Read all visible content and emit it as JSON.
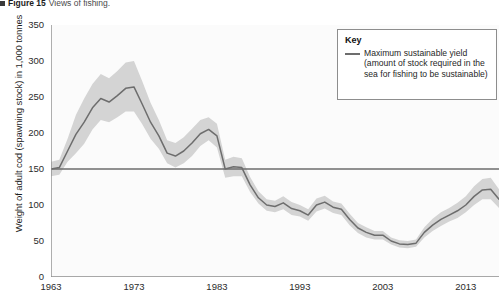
{
  "caption": {
    "figure_label": "Figure 15",
    "text": "Views of fishing."
  },
  "legend": {
    "title": "Key",
    "entries": [
      {
        "label": "Maximum sustainable yield (amount of stock required in the sea for fishing to be sustainable)",
        "color": "#6d6d6d"
      }
    ]
  },
  "colors": {
    "line": "#6d6d6d",
    "band": "#d2d2d2",
    "axis": "#8d8d8d",
    "msy_line": "#6d6d6d",
    "background": "#fbfbfb",
    "text": "#1f1f1f"
  },
  "chart_data": {
    "type": "line",
    "title": "",
    "xlabel": "",
    "ylabel": "Weight of adult cod (spawning stock) in 1,000 tonnes",
    "xlim": [
      1963,
      2017
    ],
    "ylim": [
      0,
      350
    ],
    "grid": false,
    "legend_position": "top-right",
    "yticks": [
      0,
      50,
      100,
      150,
      200,
      250,
      300,
      350
    ],
    "ytick_labels": [
      "0",
      "50",
      "100",
      "150",
      "200",
      "250",
      "300",
      "350"
    ],
    "xticks": [
      1963,
      1973,
      1983,
      1993,
      2003,
      2013
    ],
    "xtick_labels": [
      "1963",
      "1973",
      "1983",
      "1993",
      "2003",
      "2013"
    ],
    "x": [
      1963,
      1964,
      1965,
      1966,
      1967,
      1968,
      1969,
      1970,
      1971,
      1972,
      1973,
      1974,
      1975,
      1976,
      1977,
      1978,
      1979,
      1980,
      1981,
      1982,
      1983,
      1984,
      1985,
      1986,
      1987,
      1988,
      1989,
      1990,
      1991,
      1992,
      1993,
      1994,
      1995,
      1996,
      1997,
      1998,
      1999,
      2000,
      2001,
      2002,
      2003,
      2004,
      2005,
      2006,
      2007,
      2008,
      2009,
      2010,
      2011,
      2012,
      2013,
      2014,
      2015,
      2016,
      2017
    ],
    "series": [
      {
        "name": "Adult cod spawning stock biomass",
        "values": [
          150,
          152,
          175,
          198,
          215,
          235,
          248,
          243,
          252,
          262,
          264,
          240,
          215,
          196,
          172,
          168,
          175,
          186,
          199,
          205,
          196,
          150,
          153,
          152,
          128,
          110,
          100,
          98,
          103,
          95,
          92,
          86,
          100,
          104,
          97,
          94,
          80,
          68,
          62,
          58,
          58,
          50,
          46,
          45,
          47,
          62,
          72,
          80,
          86,
          92,
          100,
          112,
          121,
          122,
          108
        ],
        "band_low": [
          140,
          142,
          160,
          172,
          185,
          205,
          218,
          215,
          222,
          230,
          230,
          212,
          192,
          178,
          158,
          152,
          158,
          168,
          182,
          190,
          180,
          138,
          140,
          140,
          118,
          102,
          92,
          90,
          94,
          86,
          84,
          78,
          91,
          95,
          89,
          86,
          72,
          61,
          55,
          52,
          52,
          45,
          41,
          40,
          42,
          55,
          64,
          71,
          77,
          82,
          90,
          100,
          108,
          108,
          96
        ],
        "band_high": [
          160,
          163,
          192,
          225,
          248,
          268,
          282,
          276,
          286,
          298,
          300,
          272,
          242,
          218,
          190,
          186,
          194,
          206,
          218,
          222,
          213,
          163,
          167,
          165,
          139,
          119,
          108,
          106,
          112,
          104,
          100,
          94,
          109,
          113,
          105,
          102,
          88,
          75,
          69,
          64,
          64,
          55,
          51,
          50,
          52,
          69,
          81,
          90,
          96,
          103,
          112,
          126,
          136,
          138,
          122
        ]
      }
    ],
    "reference_lines": [
      {
        "name": "Maximum sustainable yield",
        "orientation": "horizontal",
        "value": 150
      }
    ]
  }
}
